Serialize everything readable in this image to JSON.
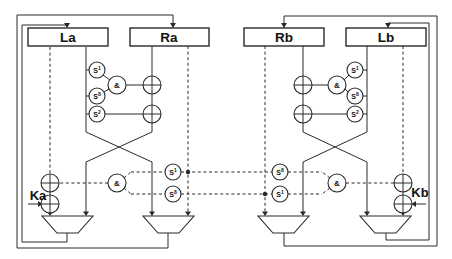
{
  "diagram": {
    "registers": {
      "la": "La",
      "ra": "Ra",
      "rb": "Rb",
      "lb": "Lb"
    },
    "keys": {
      "ka": "Ka",
      "kb": "Kb"
    },
    "and_gate_label": "&",
    "sboxes": {
      "s1": {
        "base": "S",
        "exp": "1"
      },
      "s8": {
        "base": "S",
        "exp": "8"
      },
      "s2": {
        "base": "S",
        "exp": "2"
      }
    }
  }
}
